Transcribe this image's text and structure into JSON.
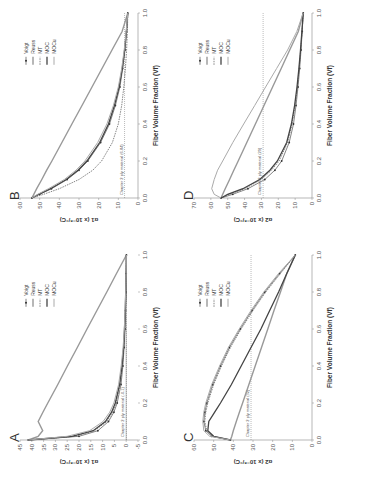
{
  "figure": {
    "orientation": "rotated-90-ccw",
    "caption": "",
    "legend_entries": [
      "Voigt",
      "Reuss",
      "MT",
      "MOC",
      "MOCu"
    ]
  },
  "chart_data": [
    {
      "panel": "A",
      "type": "line",
      "xlabel": "Fiber Volume Fraction (Vf)",
      "ylabel": "α1 (x 10⁻⁶/°C)",
      "xlim": [
        0,
        1
      ],
      "ylim": [
        -5,
        45
      ],
      "xticks": [
        "0.0",
        "0.2",
        "0.4",
        "0.6",
        "0.8",
        "1.0"
      ],
      "yticks": [
        "-5",
        "0",
        "5",
        "10",
        "15",
        "20",
        "25",
        "30",
        "35",
        "40",
        "45"
      ],
      "reference_line": {
        "label": "Chapter 2 ply material (-0.1)",
        "y": -0.1
      },
      "legend": [
        "Voigt",
        "Reuss",
        "MT",
        "MOC",
        "MOCu"
      ],
      "x": [
        0.0,
        0.02,
        0.05,
        0.1,
        0.15,
        0.2,
        0.3,
        0.4,
        0.5,
        0.6,
        0.7,
        0.8,
        0.9,
        1.0
      ],
      "series": [
        {
          "name": "Voigt",
          "values": [
            41.5,
            20,
            12,
            7.5,
            5.2,
            3.8,
            2.2,
            1.4,
            0.9,
            0.5,
            0.3,
            0.1,
            0.0,
            -0.1
          ]
        },
        {
          "name": "Reuss",
          "values": [
            41.5,
            37.3,
            35.4,
            37.3,
            35.3,
            33.2,
            29.0,
            24.9,
            20.7,
            16.6,
            12.4,
            8.2,
            4.1,
            -0.1
          ]
        },
        {
          "name": "MT",
          "values": [
            41.5,
            22,
            13.5,
            8.2,
            5.8,
            4.3,
            2.6,
            1.6,
            1.0,
            0.6,
            0.3,
            0.1,
            0.0,
            -0.1
          ]
        },
        {
          "name": "MOC",
          "values": [
            41.5,
            23,
            14,
            8.8,
            6.2,
            4.6,
            2.8,
            1.8,
            1.1,
            0.7,
            0.4,
            0.2,
            0.0,
            -0.1
          ]
        },
        {
          "name": "MOCu",
          "values": [
            41.5,
            25,
            15.5,
            9.8,
            7.0,
            5.2,
            3.2,
            2.1,
            1.3,
            0.8,
            0.5,
            0.2,
            0.0,
            -0.1
          ]
        }
      ]
    },
    {
      "panel": "B",
      "type": "line",
      "xlabel": "Fiber Volume Fraction (Vf)",
      "ylabel": "α1 (x 10⁻⁶/°C)",
      "xlim": [
        0,
        1
      ],
      "ylim": [
        0,
        60
      ],
      "xticks": [
        "0.0",
        "0.2",
        "0.4",
        "0.6",
        "0.8",
        "1.0"
      ],
      "yticks": [
        "0",
        "10",
        "20",
        "30",
        "40",
        "50",
        "60"
      ],
      "reference_line": {
        "label": "Chapter 2 ply material (6.84)",
        "y": 6.84
      },
      "legend": [
        "Voigt",
        "Reuss",
        "MT",
        "MOC",
        "MOCu"
      ],
      "x": [
        0.0,
        0.02,
        0.05,
        0.1,
        0.15,
        0.2,
        0.3,
        0.4,
        0.5,
        0.6,
        0.7,
        0.8,
        0.9,
        1.0
      ],
      "series": [
        {
          "name": "Voigt",
          "values": [
            54,
            50,
            44,
            36,
            30,
            25.5,
            19,
            14.5,
            11.5,
            9.2,
            7.8,
            6.6,
            5.8,
            5.2
          ]
        },
        {
          "name": "Reuss",
          "values": [
            54,
            53,
            51.5,
            48.9,
            46.4,
            43.8,
            38.7,
            33.6,
            28.5,
            23.4,
            18.3,
            13.2,
            8.1,
            5.2
          ]
        },
        {
          "name": "MT",
          "values": [
            54,
            48,
            40,
            30,
            23,
            18.5,
            13,
            10,
            8.3,
            7.2,
            6.4,
            5.8,
            5.4,
            5.2
          ]
        },
        {
          "name": "MOC",
          "values": [
            54,
            50.5,
            44.5,
            36.5,
            30.5,
            26,
            19.5,
            15,
            12,
            9.6,
            8,
            6.8,
            5.9,
            5.2
          ]
        },
        {
          "name": "MOCu",
          "values": [
            54,
            51,
            45.5,
            37.5,
            31.5,
            27,
            20.5,
            15.8,
            12.5,
            10,
            8.3,
            7,
            6,
            5.2
          ]
        }
      ]
    },
    {
      "panel": "C",
      "type": "line",
      "xlabel": "Fiber Volume Fraction (Vf)",
      "ylabel": "α2 (x 10⁻⁶/°C)",
      "xlim": [
        0,
        1
      ],
      "ylim": [
        0,
        60
      ],
      "xticks": [
        "0.0",
        "0.2",
        "0.4",
        "0.6",
        "0.8",
        "1.0"
      ],
      "yticks": [
        "0",
        "10",
        "20",
        "30",
        "40",
        "50",
        "60"
      ],
      "reference_line": {
        "label": "Chapter 2 ply material (32)",
        "y": 31
      },
      "legend": [
        "Voigt",
        "Reuss",
        "MT",
        "MOC",
        "MOCu"
      ],
      "x": [
        0.0,
        0.02,
        0.05,
        0.1,
        0.15,
        0.2,
        0.3,
        0.4,
        0.5,
        0.6,
        0.7,
        0.8,
        0.9,
        1.0
      ],
      "series": [
        {
          "name": "Voigt",
          "values": [
            41.5,
            51,
            54,
            55,
            54.5,
            53.5,
            50.5,
            46.5,
            42,
            36.5,
            30.5,
            24,
            16.5,
            8.5
          ]
        },
        {
          "name": "Reuss",
          "values": [
            41.5,
            40.8,
            40.0,
            38.5,
            36.9,
            35.3,
            32.1,
            28.9,
            25.7,
            22.5,
            19.3,
            16.0,
            12.8,
            8.5
          ]
        },
        {
          "name": "MT",
          "values": [
            41.5,
            50.5,
            53.5,
            54.5,
            54,
            53,
            50,
            46,
            41.5,
            36,
            30,
            23.5,
            16,
            8.5
          ]
        },
        {
          "name": "MOC",
          "values": [
            41.5,
            50,
            53,
            52.5,
            49.5,
            46.5,
            41,
            36,
            31,
            26,
            21.5,
            17,
            12.8,
            8.5
          ]
        },
        {
          "name": "MOCu",
          "values": [
            41.5,
            52,
            55,
            55.5,
            55,
            54,
            51,
            47,
            42.5,
            37,
            31,
            24.5,
            17,
            8.5
          ]
        }
      ]
    },
    {
      "panel": "D",
      "type": "line",
      "xlabel": "Fiber Volume Fraction (Vf)",
      "ylabel": "α2 (x 10⁻⁶/°C)",
      "xlim": [
        0,
        1
      ],
      "ylim": [
        0,
        70
      ],
      "xticks": [
        "0.0",
        "0.2",
        "0.4",
        "0.6",
        "0.8",
        "1.0"
      ],
      "yticks": [
        "0",
        "10",
        "20",
        "30",
        "40",
        "50",
        "60",
        "70"
      ],
      "reference_line": {
        "label": "Chapter 2 ply material (29)",
        "y": 29
      },
      "legend": [
        "Voigt",
        "Reuss",
        "MT",
        "MOC",
        "MOCu"
      ],
      "x": [
        0.0,
        0.02,
        0.05,
        0.1,
        0.15,
        0.2,
        0.3,
        0.4,
        0.5,
        0.6,
        0.7,
        0.8,
        0.9,
        1.0
      ],
      "series": [
        {
          "name": "Voigt",
          "values": [
            54,
            47,
            38,
            28,
            22,
            18,
            13.5,
            11,
            9.5,
            8.3,
            7.3,
            6.5,
            5.8,
            5.2
          ]
        },
        {
          "name": "Reuss",
          "values": [
            54,
            53,
            51.5,
            48.9,
            46.4,
            43.8,
            38.7,
            33.6,
            28.5,
            23.4,
            18.3,
            13.2,
            8.1,
            5.2
          ]
        },
        {
          "name": "MT",
          "values": [
            54,
            49,
            40,
            30,
            24,
            19.5,
            14.5,
            11.8,
            10,
            8.7,
            7.6,
            6.7,
            5.9,
            5.2
          ]
        },
        {
          "name": "MOC",
          "values": [
            54,
            50,
            41,
            31,
            25,
            20.5,
            15,
            12.2,
            10.3,
            8.9,
            7.8,
            6.8,
            6,
            5.2
          ]
        },
        {
          "name": "MOCu",
          "values": [
            54,
            58,
            59.5,
            58,
            56,
            53,
            47,
            40.5,
            34,
            27.5,
            21,
            14.5,
            9,
            5.2
          ]
        }
      ]
    }
  ]
}
